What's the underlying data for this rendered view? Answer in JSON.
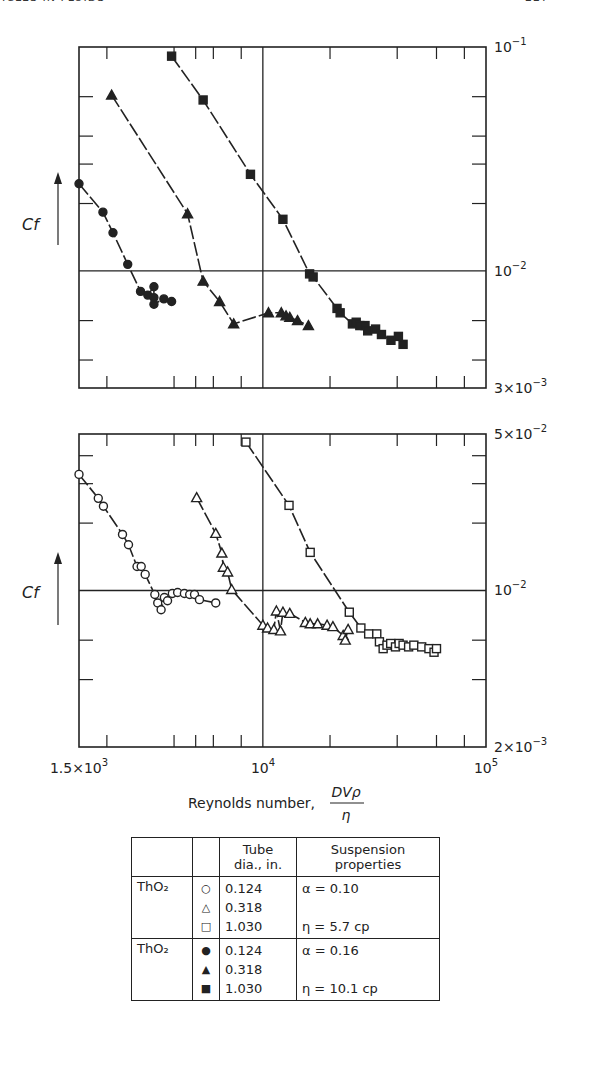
{
  "page_header": {
    "left": "ICLES IN FLUIDS",
    "right": "227"
  },
  "chart_data": [
    {
      "type": "scatter",
      "title": "",
      "panel": "top",
      "xlabel": "Reynolds number, DVρ/η",
      "ylabel": "Cf",
      "xscale": "log",
      "yscale": "log",
      "xlim": [
        1500,
        100000
      ],
      "ylim": [
        0.003,
        0.1
      ],
      "y_tick_labels": [
        "10^-1",
        "10^-2",
        "3×10^-3"
      ],
      "gridlines": {
        "x": [
          10000
        ],
        "y": [
          0.01
        ]
      },
      "series": [
        {
          "name": "ThO2 0.124 in (α=0.16)",
          "marker": "filled-circle",
          "points": [
            [
              1500,
              0.0245
            ],
            [
              1920,
              0.0183
            ],
            [
              2130,
              0.0148
            ],
            [
              2480,
              0.0107
            ],
            [
              2830,
              0.0081
            ],
            [
              3050,
              0.0078
            ],
            [
              3250,
              0.0085
            ],
            [
              3250,
              0.0076
            ],
            [
              3250,
              0.0071
            ],
            [
              3600,
              0.0075
            ],
            [
              3900,
              0.0073
            ]
          ]
        },
        {
          "name": "ThO2 0.318 in (α=0.16)",
          "marker": "filled-triangle",
          "points": [
            [
              2100,
              0.061
            ],
            [
              4600,
              0.018
            ],
            [
              5400,
              0.009
            ],
            [
              6400,
              0.0073
            ],
            [
              7400,
              0.0058
            ],
            [
              10600,
              0.0065
            ],
            [
              12100,
              0.0065
            ],
            [
              12700,
              0.0063
            ],
            [
              13200,
              0.0062
            ],
            [
              14300,
              0.006
            ],
            [
              16000,
              0.0057
            ]
          ]
        },
        {
          "name": "ThO2 1.030 in (α=0.16)",
          "marker": "filled-square",
          "points": [
            [
              3900,
              0.091
            ],
            [
              5400,
              0.058
            ],
            [
              8800,
              0.027
            ],
            [
              12300,
              0.017
            ],
            [
              16200,
              0.0097
            ],
            [
              16800,
              0.0094
            ],
            [
              21500,
              0.0068
            ],
            [
              22200,
              0.0065
            ],
            [
              25200,
              0.0058
            ],
            [
              26200,
              0.0059
            ],
            [
              27200,
              0.0057
            ],
            [
              28700,
              0.0057
            ],
            [
              29500,
              0.0054
            ],
            [
              32000,
              0.0055
            ],
            [
              34000,
              0.0052
            ],
            [
              37500,
              0.0049
            ],
            [
              40500,
              0.0051
            ],
            [
              42500,
              0.0047
            ]
          ]
        }
      ]
    },
    {
      "type": "scatter",
      "title": "",
      "panel": "bottom",
      "xlabel": "Reynolds number, DVρ/η",
      "ylabel": "Cf",
      "xscale": "log",
      "yscale": "log",
      "xlim": [
        1500,
        100000
      ],
      "ylim": [
        0.002,
        0.05
      ],
      "x_tick_labels": [
        "1.5×10^3",
        "10^4",
        "10^5"
      ],
      "y_tick_labels": [
        "5×10^-2",
        "10^-2",
        "2×10^-3"
      ],
      "gridlines": {
        "x": [
          10000
        ],
        "y": [
          0.01
        ]
      },
      "series": [
        {
          "name": "ThO2 0.124 in (α=0.10, η=5.7 cp)",
          "marker": "open-circle",
          "points": [
            [
              1500,
              0.033
            ],
            [
              1830,
              0.0258
            ],
            [
              1930,
              0.0238
            ],
            [
              2350,
              0.0178
            ],
            [
              2500,
              0.016
            ],
            [
              2730,
              0.0128
            ],
            [
              2850,
              0.0128
            ],
            [
              2970,
              0.0118
            ],
            [
              3280,
              0.0096
            ],
            [
              3380,
              0.0088
            ],
            [
              3500,
              0.0082
            ],
            [
              3620,
              0.0093
            ],
            [
              3740,
              0.009
            ],
            [
              3930,
              0.0097
            ],
            [
              4150,
              0.0098
            ],
            [
              4450,
              0.0097
            ],
            [
              4700,
              0.0096
            ],
            [
              4940,
              0.0096
            ],
            [
              5200,
              0.0091
            ],
            [
              6150,
              0.0088
            ]
          ]
        },
        {
          "name": "ThO2 0.318 in",
          "marker": "open-triangle",
          "points": [
            [
              5050,
              0.026
            ],
            [
              6150,
              0.018
            ],
            [
              6550,
              0.0147
            ],
            [
              6650,
              0.0127
            ],
            [
              6950,
              0.0121
            ],
            [
              7250,
              0.0101
            ],
            [
              10000,
              0.007
            ],
            [
              10500,
              0.0068
            ],
            [
              11200,
              0.0067
            ],
            [
              12000,
              0.0066
            ],
            [
              11500,
              0.0081
            ],
            [
              12300,
              0.008
            ],
            [
              13200,
              0.0079
            ],
            [
              15500,
              0.0072
            ],
            [
              16300,
              0.0071
            ],
            [
              17600,
              0.0071
            ],
            [
              19400,
              0.007
            ],
            [
              20600,
              0.0069
            ],
            [
              22900,
              0.0063
            ],
            [
              24100,
              0.0067
            ],
            [
              23400,
              0.006
            ]
          ]
        },
        {
          "name": "ThO2 1.030 in",
          "marker": "open-square",
          "points": [
            [
              8400,
              0.046
            ],
            [
              13100,
              0.024
            ],
            [
              16300,
              0.0148
            ],
            [
              24400,
              0.008
            ],
            [
              27500,
              0.0068
            ],
            [
              29800,
              0.0064
            ],
            [
              32400,
              0.0064
            ],
            [
              33300,
              0.0059
            ],
            [
              34600,
              0.0055
            ],
            [
              36000,
              0.0057
            ],
            [
              37400,
              0.0058
            ],
            [
              39300,
              0.0056
            ],
            [
              40800,
              0.0058
            ],
            [
              42500,
              0.0057
            ],
            [
              45000,
              0.0056
            ],
            [
              47500,
              0.0057
            ],
            [
              51500,
              0.0056
            ],
            [
              55500,
              0.0055
            ],
            [
              60000,
              0.0055
            ],
            [
              58500,
              0.0053
            ]
          ]
        }
      ]
    }
  ],
  "axes": {
    "top_right_labels": [
      {
        "text": "10",
        "exp": "−1",
        "y": 47
      },
      {
        "text": "10",
        "exp": "−2",
        "y": 271
      },
      {
        "text": "3×10",
        "exp": "−3",
        "y": 388
      }
    ],
    "bottom_right_labels": [
      {
        "text": "5×10",
        "exp": "−2",
        "y": 434
      },
      {
        "text": "10",
        "exp": "−2",
        "y": 590
      },
      {
        "text": "2×10",
        "exp": "−3",
        "y": 747
      }
    ],
    "x_labels": [
      {
        "text": "1.5×10",
        "exp": "3",
        "x": 79
      },
      {
        "text": "10",
        "exp": "4",
        "x": 263
      },
      {
        "text": "10",
        "exp": "5",
        "x": 486
      }
    ],
    "ylabel_top": "Cf",
    "ylabel_bottom": "Cf",
    "xlabel_text": "Reynolds number,",
    "xlabel_frac_num": "DVρ",
    "xlabel_frac_den": "η"
  },
  "legend_table": {
    "headers": [
      "",
      "",
      "Tube dia., in.",
      "Suspension properties"
    ],
    "header_line1": [
      "Tube",
      "Suspension"
    ],
    "header_line2": [
      "dia., in.",
      "properties"
    ],
    "groups": [
      {
        "material": "ThO₂",
        "symbols": [
          "○",
          "△",
          "□"
        ],
        "diameters": [
          "0.124",
          "0.318",
          "1.030"
        ],
        "props": [
          "α = 0.10",
          "",
          "η = 5.7 cp"
        ]
      },
      {
        "material": "ThO₂",
        "symbols": [
          "●",
          "▲",
          "■"
        ],
        "diameters": [
          "0.124",
          "0.318",
          "1.030"
        ],
        "props": [
          "α = 0.16",
          "",
          "η = 10.1 cp"
        ]
      }
    ]
  }
}
